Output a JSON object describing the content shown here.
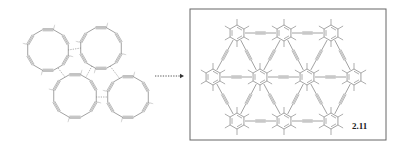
{
  "figure": {
    "left_panel": {
      "type": "macrocycle-assembly",
      "macrocycle_count": 4,
      "rings": [
        {
          "cx": 48,
          "cy": 50,
          "r": 21
        },
        {
          "cx": 101,
          "cy": 48,
          "r": 21
        },
        {
          "cx": 75,
          "cy": 96,
          "r": 22
        },
        {
          "cx": 128,
          "cy": 97,
          "r": 21
        }
      ]
    },
    "arrow": {
      "style": "dotted",
      "direction": "right",
      "x1": 155,
      "x2": 184,
      "y": 76
    },
    "right_panel": {
      "type": "graphyne-network",
      "boxed": true,
      "box": {
        "x": 190,
        "y": 9,
        "w": 196,
        "h": 131
      },
      "benzene_rings": [
        {
          "cx": 237,
          "cy": 33
        },
        {
          "cx": 284,
          "cy": 33
        },
        {
          "cx": 331,
          "cy": 33
        },
        {
          "cx": 213,
          "cy": 77
        },
        {
          "cx": 260,
          "cy": 77
        },
        {
          "cx": 307,
          "cy": 77
        },
        {
          "cx": 354,
          "cy": 77
        },
        {
          "cx": 237,
          "cy": 121
        },
        {
          "cx": 284,
          "cy": 121
        },
        {
          "cx": 331,
          "cy": 121
        }
      ],
      "compound_label": "2.11"
    },
    "colors": {
      "line": "#8a8a8a",
      "box": "#666666",
      "label": "#222222"
    }
  }
}
